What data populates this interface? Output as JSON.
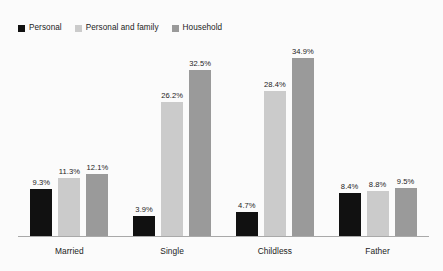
{
  "chart_data": {
    "type": "bar",
    "title": "",
    "subtitle": "",
    "xlabel": "",
    "ylabel": "",
    "ylim": [
      0,
      38
    ],
    "grid": false,
    "legend_position": "top-left",
    "value_suffix": "%",
    "categories": [
      "Married",
      "Single",
      "Childless",
      "Father"
    ],
    "series": [
      {
        "name": "Personal",
        "color": "#111111",
        "values": [
          9.3,
          3.9,
          4.7,
          8.4
        ],
        "labels": [
          "9.3%",
          "3.9%",
          "4.7%",
          "8.4%"
        ]
      },
      {
        "name": "Personal and family",
        "color": "#cbcbcb",
        "values": [
          11.3,
          26.2,
          28.4,
          8.8
        ],
        "labels": [
          "11.3%",
          "26.2%",
          "28.4%",
          "8.8%"
        ]
      },
      {
        "name": "Household",
        "color": "#9a9a9a",
        "values": [
          12.1,
          32.5,
          34.9,
          9.5
        ],
        "labels": [
          "12.1%",
          "32.5%",
          "34.9%",
          "9.5%"
        ]
      }
    ]
  },
  "legend": {
    "items": [
      {
        "label": "Personal",
        "color": "#111111"
      },
      {
        "label": "Personal and family",
        "color": "#cbcbcb"
      },
      {
        "label": "Household",
        "color": "#9a9a9a"
      }
    ]
  },
  "axis": {
    "line_color": "#a9a9a9",
    "labels": [
      "Married",
      "Single",
      "Childless",
      "Father"
    ]
  },
  "background_color": "#fbfbfb"
}
